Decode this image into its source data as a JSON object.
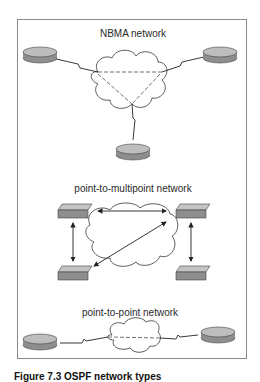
{
  "diagram": {
    "sections": [
      {
        "id": "nbma",
        "title": "NBMA network",
        "devices": [
          "router",
          "router",
          "router"
        ],
        "links": "serial (lightning)",
        "virtual_links": "dashed triangle"
      },
      {
        "id": "p2mp",
        "title": "point-to-multipoint network",
        "devices": [
          "switch",
          "switch",
          "switch",
          "switch"
        ],
        "links": "arrows"
      },
      {
        "id": "p2p",
        "title": "point-to-point network",
        "devices": [
          "router",
          "router"
        ],
        "links": "serial with dashed virtual link"
      }
    ],
    "caption": "Figure 7.3   OSPF network types",
    "colors": {
      "device_fill": "#9a9a9a",
      "device_top": "#bdbdbd",
      "frame": "#8a8a8a",
      "line": "#222222"
    }
  }
}
